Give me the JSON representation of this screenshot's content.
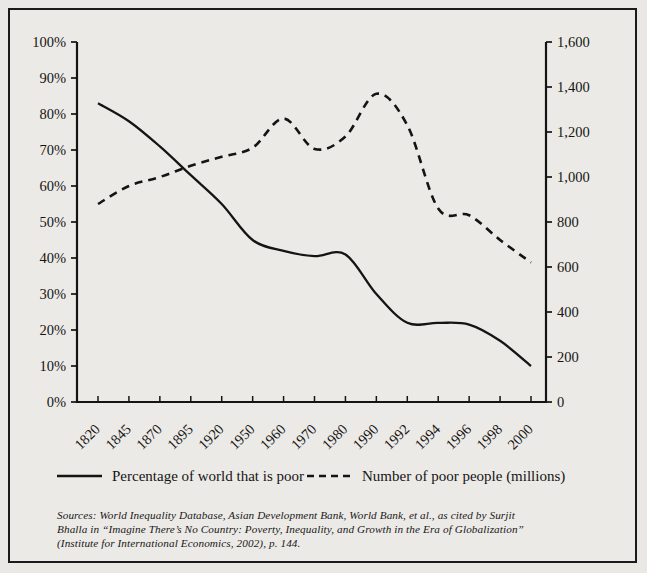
{
  "figure": {
    "background_color": "#eceae6",
    "border_color": "#1a1a1a",
    "ink_color": "#141414"
  },
  "legend": {
    "items": [
      {
        "label": "Percentage of world that is poor",
        "style": "solid",
        "axis": "left"
      },
      {
        "label": "Number of poor people (millions)",
        "style": "dashed",
        "axis": "right"
      }
    ]
  },
  "source_note": {
    "line1": "Sources: World Inequality Database, Asian Development Bank, World Bank, et al., as cited by Surjit",
    "line2": "Bhalla in “Imagine There’s No Country: Poverty, Inequality, and Growth in the Era of Globalization”",
    "line3": "(Institute for International Economics, 2002), p. 144."
  },
  "chart_data": {
    "type": "line",
    "title": "",
    "xlabel": "",
    "grid": false,
    "legend_position": "bottom",
    "categories": [
      "1820",
      "1845",
      "1870",
      "1895",
      "1920",
      "1950",
      "1960",
      "1970",
      "1980",
      "1990",
      "1992",
      "1994",
      "1996",
      "1998",
      "2000"
    ],
    "left_axis": {
      "label": "Percentage of world that is poor",
      "ylim": [
        0,
        100
      ],
      "tick_step": 10,
      "tick_labels": [
        "0%",
        "10%",
        "20%",
        "30%",
        "40%",
        "50%",
        "60%",
        "70%",
        "80%",
        "90%",
        "100%"
      ],
      "tick_values": [
        0,
        10,
        20,
        30,
        40,
        50,
        60,
        70,
        80,
        90,
        100
      ]
    },
    "right_axis": {
      "label": "Number of poor people (millions)",
      "ylim": [
        0,
        1600
      ],
      "tick_step": 200,
      "tick_labels": [
        "0",
        "200",
        "400",
        "600",
        "800",
        "1,000",
        "1,200",
        "1,400",
        "1,600"
      ],
      "tick_values": [
        0,
        200,
        400,
        600,
        800,
        1000,
        1200,
        1400,
        1600
      ]
    },
    "series": [
      {
        "name": "Percentage of world that is poor",
        "style": "solid",
        "axis": "left",
        "values": [
          83,
          78,
          71,
          63,
          55,
          45,
          42,
          40.5,
          41,
          30,
          22,
          22,
          21.5,
          17,
          10
        ]
      },
      {
        "name": "Number of poor people (millions)",
        "style": "dashed",
        "axis": "right",
        "values": [
          880,
          960,
          1000,
          1050,
          1090,
          1130,
          1260,
          1125,
          1180,
          1370,
          1230,
          860,
          830,
          720,
          620
        ]
      }
    ]
  }
}
